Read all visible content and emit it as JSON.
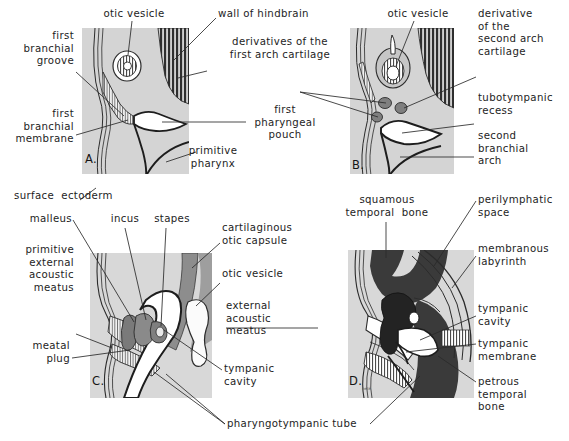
{
  "figure": {
    "type": "anatomical-diagram",
    "panel_count": 4
  },
  "palette": {
    "mesenchyme_fill": "#d2d2d2",
    "mesenchyme_light": "#dedede",
    "cartilage_gray": "#8f8f8f",
    "dark_bone": "#3a3a3a",
    "stripe_dark": "#2f2f2f",
    "white_lumen": "#ffffff",
    "ink": "#1d1d1d",
    "leader_line": "#2b2b2b"
  },
  "panels": [
    {
      "id": "A",
      "letter": "A.",
      "labels": [
        {
          "key": "otic_vesicle",
          "text": "otic vesicle",
          "align": "center"
        },
        {
          "key": "wall_of_hindbrain",
          "text": "wall of hindbrain",
          "align": "left"
        },
        {
          "key": "first_branchial_groove",
          "text": "first\nbranchial\ngroove",
          "align": "right"
        },
        {
          "key": "derivatives_first_arch",
          "text": "derivatives of the\nfirst arch cartilage",
          "align": "center"
        },
        {
          "key": "first_branchial_membrane",
          "text": "first\nbranchial\nmembrane",
          "align": "right"
        },
        {
          "key": "first_pharyngeal_pouch",
          "text": "first\npharyngeal\npouch",
          "align": "center"
        },
        {
          "key": "primitive_pharynx",
          "text": "primitive\npharynx",
          "align": "center"
        }
      ]
    },
    {
      "id": "B",
      "letter": "B.",
      "labels": [
        {
          "key": "otic_vesicle",
          "text": "otic vesicle",
          "align": "center"
        },
        {
          "key": "derivative_second_arch",
          "text": "derivative\nof the\nsecond arch\ncartilage",
          "align": "left"
        },
        {
          "key": "tubotympanic_recess",
          "text": "tubotympanic\nrecess",
          "align": "left"
        },
        {
          "key": "second_branchial_arch",
          "text": "second\nbranchial\narch",
          "align": "left"
        }
      ]
    },
    {
      "id": "C",
      "letter": "C.",
      "labels": [
        {
          "key": "surface_ectoderm",
          "text": "surface  ectoderm",
          "align": "left"
        },
        {
          "key": "malleus",
          "text": "malleus",
          "align": "right"
        },
        {
          "key": "incus",
          "text": "incus",
          "align": "center"
        },
        {
          "key": "stapes",
          "text": "stapes",
          "align": "center"
        },
        {
          "key": "cartilaginous_otic_capsule",
          "text": "cartilaginous\notic capsule",
          "align": "left"
        },
        {
          "key": "otic_vesicle",
          "text": "otic vesicle",
          "align": "left"
        },
        {
          "key": "primitive_eam",
          "text": "primitive\nexternal\nacoustic\nmeatus",
          "align": "right"
        },
        {
          "key": "external_acoustic_meatus",
          "text": "external\nacoustic\nmeatus",
          "align": "left"
        },
        {
          "key": "meatal_plug",
          "text": "meatal\nplug",
          "align": "right"
        },
        {
          "key": "tympanic_cavity",
          "text": "tympanic\ncavity",
          "align": "left"
        },
        {
          "key": "pharyngotympanic_tube",
          "text": "pharyngotympanic tube",
          "align": "left"
        }
      ]
    },
    {
      "id": "D",
      "letter": "D.",
      "labels": [
        {
          "key": "squamous_temporal_bone",
          "text": "squamous\ntemporal  bone",
          "align": "center"
        },
        {
          "key": "perilymphatic_space",
          "text": "perilymphatic\nspace",
          "align": "left"
        },
        {
          "key": "membranous_labyrinth",
          "text": "membranous\nlabyrinth",
          "align": "left"
        },
        {
          "key": "tympanic_cavity",
          "text": "tympanic\ncavity",
          "align": "left"
        },
        {
          "key": "tympanic_membrane",
          "text": "tympanic\nmembrane",
          "align": "left"
        },
        {
          "key": "petrous_temporal_bone",
          "text": "petrous\ntemporal\nbone",
          "align": "left"
        }
      ]
    }
  ],
  "artist_signature": "neté"
}
